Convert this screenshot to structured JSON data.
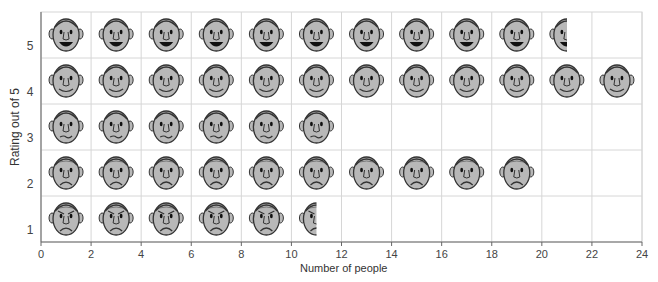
{
  "chart_data": {
    "type": "pictogram",
    "title": "",
    "xlabel": "Number of people",
    "ylabel": "Rating out of 5",
    "xlim": [
      0,
      24
    ],
    "x_ticks": [
      0,
      2,
      4,
      6,
      8,
      10,
      12,
      14,
      16,
      18,
      20,
      22,
      24
    ],
    "y_ticks": [
      1,
      2,
      3,
      4,
      5
    ],
    "grid": true,
    "icon_value": 2,
    "categories": [
      "5",
      "4",
      "3",
      "2",
      "1"
    ],
    "values": [
      21,
      24,
      12,
      20,
      11
    ],
    "faces": [
      {
        "rating": 5,
        "count": 21,
        "expression": "laughing"
      },
      {
        "rating": 4,
        "count": 24,
        "expression": "smiling"
      },
      {
        "rating": 3,
        "count": 12,
        "expression": "neutral"
      },
      {
        "rating": 2,
        "count": 20,
        "expression": "sad"
      },
      {
        "rating": 1,
        "count": 11,
        "expression": "angry"
      }
    ]
  },
  "colors": {
    "face_fill": "#b8b8b8",
    "face_stroke": "#333333",
    "grid": "#d6d6d6",
    "axis": "#666666"
  }
}
